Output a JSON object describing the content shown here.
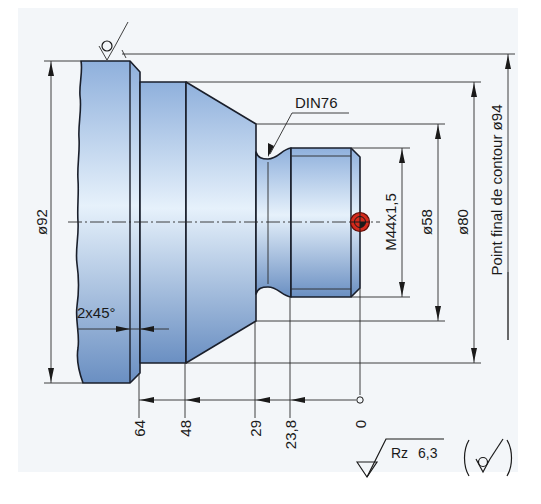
{
  "drawing": {
    "title": "Turned part with threaded pin",
    "colors": {
      "part_light": "#e4f0fb",
      "part_dark": "#6f93c4",
      "outline": "#1a1f2b",
      "zero_point_marker": "#d42a1c",
      "paper": "#f3f6f9"
    },
    "labels": {
      "din": "DIN76",
      "thread": "M44x1,5",
      "dia_92": "ø92",
      "dia_58": "ø58",
      "dia_80": "ø80",
      "contour_end": "Point final de contour ø94",
      "chamfer": "2x45°",
      "roughness_param": "Rz",
      "roughness_value": "6,3"
    },
    "x_dimensions": [
      {
        "label": "64",
        "x": 139
      },
      {
        "label": "48",
        "x": 185
      },
      {
        "label": "29",
        "x": 255
      },
      {
        "label": "23,8",
        "x": 290
      },
      {
        "label": "0",
        "x": 360
      }
    ],
    "diameters": [
      {
        "label": "ø92",
        "side": "left"
      },
      {
        "label": "M44x1,5",
        "side": "right"
      },
      {
        "label": "ø58",
        "side": "right"
      },
      {
        "label": "ø80",
        "side": "right"
      },
      {
        "label": "Point final de contour ø94",
        "side": "right"
      }
    ],
    "symbols": [
      "surface-roughness-symbol",
      "workpiece-zero-point-marker",
      "machining-symbol"
    ]
  }
}
